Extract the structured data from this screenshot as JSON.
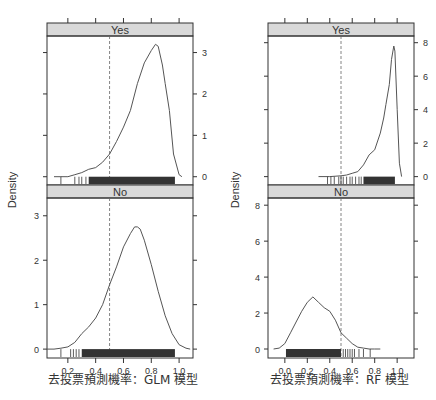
{
  "chart_data": [
    {
      "type": "area",
      "model": "GLM",
      "ylabel": "Density",
      "xlabel": "去投票預測機率：GLM 模型",
      "xlim": [
        0.05,
        1.1
      ],
      "x_ticks": [
        0.2,
        0.4,
        0.6,
        0.8,
        1.0
      ],
      "x_tick_labels": [
        "0.2",
        "0.4",
        "0.6",
        "0.8",
        "1.0"
      ],
      "threshold": 0.5,
      "panels": [
        {
          "strip": "Yes",
          "ylim": [
            -0.2,
            3.4
          ],
          "y_ticks": [
            0,
            1,
            2,
            3
          ],
          "y_tick_labels": [
            "0",
            "1",
            "2",
            "3"
          ],
          "y_axis_side": "right",
          "density": {
            "x": [
              0.1,
              0.15,
              0.2,
              0.25,
              0.3,
              0.35,
              0.4,
              0.45,
              0.5,
              0.55,
              0.6,
              0.65,
              0.7,
              0.75,
              0.8,
              0.83,
              0.85,
              0.88,
              0.9,
              0.93,
              0.96,
              1.0,
              1.02
            ],
            "y": [
              0.0,
              0.0,
              0.0,
              0.05,
              0.1,
              0.18,
              0.22,
              0.35,
              0.55,
              0.85,
              1.2,
              1.6,
              2.25,
              2.75,
              3.05,
              3.2,
              3.15,
              2.7,
              2.25,
              1.6,
              0.55,
              0.05,
              0.0
            ]
          },
          "rug": {
            "dense_from": 0.35,
            "dense_to": 0.97,
            "sparse": [
              0.15,
              0.25,
              0.28,
              0.3,
              0.33
            ]
          }
        },
        {
          "strip": "No",
          "ylim": [
            -0.2,
            3.4
          ],
          "y_ticks": [
            0,
            1,
            2,
            3
          ],
          "y_tick_labels": [
            "0",
            "1",
            "2",
            "3"
          ],
          "y_axis_side": "left",
          "density": {
            "x": [
              0.05,
              0.1,
              0.15,
              0.2,
              0.25,
              0.3,
              0.35,
              0.4,
              0.45,
              0.5,
              0.55,
              0.6,
              0.65,
              0.68,
              0.7,
              0.72,
              0.75,
              0.8,
              0.85,
              0.9,
              0.95,
              1.0,
              1.05,
              1.08
            ],
            "y": [
              0.0,
              0.0,
              0.02,
              0.05,
              0.15,
              0.35,
              0.5,
              0.7,
              1.0,
              1.45,
              1.85,
              2.3,
              2.6,
              2.75,
              2.75,
              2.7,
              2.45,
              1.9,
              1.3,
              0.75,
              0.35,
              0.1,
              0.02,
              0.0
            ]
          },
          "rug": {
            "dense_from": 0.3,
            "dense_to": 0.97,
            "sparse": [
              0.15,
              0.22,
              0.24,
              0.26,
              0.28
            ]
          }
        }
      ]
    },
    {
      "type": "area",
      "model": "RF",
      "ylabel": "Density",
      "xlabel": "去投票預測機率：RF 模型",
      "xlim": [
        -0.15,
        1.15
      ],
      "x_ticks": [
        0.0,
        0.2,
        0.4,
        0.6,
        0.8,
        1.0
      ],
      "x_tick_labels": [
        "0.0",
        "0.2",
        "0.4",
        "0.6",
        "0.8",
        "1.0"
      ],
      "threshold": 0.5,
      "panels": [
        {
          "strip": "Yes",
          "ylim": [
            -0.5,
            8.4
          ],
          "y_ticks": [
            0,
            2,
            4,
            6,
            8
          ],
          "y_tick_labels": [
            "0",
            "2",
            "4",
            "6",
            "8"
          ],
          "y_axis_side": "right",
          "density": {
            "x": [
              0.3,
              0.4,
              0.5,
              0.55,
              0.6,
              0.65,
              0.7,
              0.75,
              0.8,
              0.85,
              0.88,
              0.9,
              0.93,
              0.95,
              0.97,
              0.98,
              1.0,
              1.02,
              1.04
            ],
            "y": [
              0.0,
              0.0,
              0.05,
              0.1,
              0.2,
              0.3,
              0.7,
              1.3,
              1.6,
              2.6,
              3.5,
              4.3,
              5.5,
              7.0,
              7.8,
              7.5,
              4.0,
              0.8,
              0.0
            ]
          },
          "rug": {
            "dense_from": 0.7,
            "dense_to": 0.98,
            "sparse": [
              0.38,
              0.41,
              0.44,
              0.48,
              0.5,
              0.52,
              0.55,
              0.58,
              0.6,
              0.63,
              0.66,
              0.68
            ]
          }
        },
        {
          "strip": "No",
          "ylim": [
            -0.5,
            8.4
          ],
          "y_ticks": [
            0,
            2,
            4,
            6,
            8
          ],
          "y_tick_labels": [
            "0",
            "2",
            "4",
            "6",
            "8"
          ],
          "y_axis_side": "left",
          "density": {
            "x": [
              -0.1,
              -0.05,
              0.0,
              0.05,
              0.1,
              0.15,
              0.2,
              0.25,
              0.3,
              0.35,
              0.4,
              0.45,
              0.5,
              0.55,
              0.6,
              0.65,
              0.7,
              0.75,
              0.8,
              0.85
            ],
            "y": [
              0.0,
              0.05,
              0.3,
              0.9,
              1.5,
              2.1,
              2.6,
              2.9,
              2.6,
              2.3,
              2.1,
              1.6,
              0.9,
              0.6,
              0.3,
              0.1,
              0.05,
              0.0,
              0.0,
              0.0
            ]
          },
          "rug": {
            "dense_from": 0.01,
            "dense_to": 0.5,
            "sparse": [
              0.52,
              0.54,
              0.56,
              0.58,
              0.6,
              0.62,
              0.66,
              0.7,
              0.76
            ]
          }
        }
      ]
    }
  ],
  "layout": {
    "plots": [
      {
        "left": 47,
        "right": 193,
        "top_strip_y": 23,
        "strip_h": 13,
        "upper_bottom": 185,
        "lower_bottom": 358,
        "ylabel_x": 16,
        "xlabel_x": 48
      },
      {
        "left": 268,
        "right": 414,
        "top_strip_y": 23,
        "strip_h": 13,
        "upper_bottom": 185,
        "lower_bottom": 358,
        "ylabel_x": 239,
        "xlabel_x": 270
      }
    ],
    "colors": {
      "strip_fill": "#d9d9d9",
      "axis": "#333333",
      "curve": "#555555",
      "threshold": "#666666",
      "rug": "#333333"
    }
  }
}
